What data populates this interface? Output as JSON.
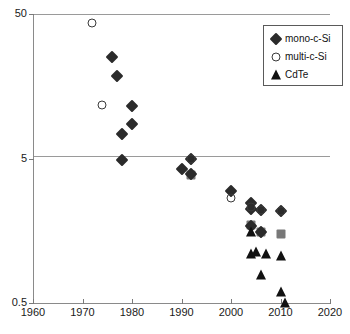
{
  "chart_data": {
    "type": "scatter",
    "title": "",
    "xlabel": "",
    "ylabel": "",
    "xlim": [
      1960,
      2020
    ],
    "ylim": [
      0.5,
      50
    ],
    "yscale": "log",
    "xticks": [
      1960,
      1970,
      1980,
      1990,
      2000,
      2010,
      2020
    ],
    "xtick_labels": [
      "1960",
      "1970",
      "1980",
      "1990",
      "2000",
      "2010",
      "2020"
    ],
    "yticks": [
      0.5,
      5,
      50
    ],
    "ytick_labels": [
      "0.5",
      "5",
      "50"
    ],
    "grid": "horizontal",
    "legend_position": "top-right",
    "series": [
      {
        "name": "mono-c-Si",
        "marker": "filled-diamond",
        "color": "#2b2b2b",
        "points": [
          {
            "x": 1976,
            "y": 25.0
          },
          {
            "x": 1977,
            "y": 18.5
          },
          {
            "x": 1980,
            "y": 11.5
          },
          {
            "x": 1980,
            "y": 8.6
          },
          {
            "x": 1978,
            "y": 7.4
          },
          {
            "x": 1978,
            "y": 4.9
          },
          {
            "x": 1992,
            "y": 5.0
          },
          {
            "x": 1990,
            "y": 4.2
          },
          {
            "x": 1992,
            "y": 3.9
          },
          {
            "x": 2000,
            "y": 3.0
          },
          {
            "x": 2004,
            "y": 2.45
          },
          {
            "x": 2004,
            "y": 2.25
          },
          {
            "x": 2006,
            "y": 2.2
          },
          {
            "x": 2010,
            "y": 2.15
          },
          {
            "x": 2004,
            "y": 1.7
          },
          {
            "x": 2006,
            "y": 1.55
          }
        ]
      },
      {
        "name": "multi-c-Si",
        "marker": "open-circle",
        "color": "#3a3a3a",
        "points": [
          {
            "x": 1972,
            "y": 43.0
          },
          {
            "x": 1974,
            "y": 11.8
          },
          {
            "x": 1992,
            "y": 5.0
          },
          {
            "x": 2000,
            "y": 2.65
          },
          {
            "x": 2004,
            "y": 2.3
          },
          {
            "x": 2006,
            "y": 2.2
          },
          {
            "x": 2010,
            "y": 2.15
          }
        ]
      },
      {
        "name": "CdTe",
        "marker": "filled-triangle",
        "color": "#111111",
        "points": [
          {
            "x": 2004,
            "y": 1.55
          },
          {
            "x": 2004,
            "y": 1.1
          },
          {
            "x": 2005,
            "y": 1.12
          },
          {
            "x": 2007,
            "y": 1.1
          },
          {
            "x": 2010,
            "y": 1.05
          },
          {
            "x": 2006,
            "y": 0.78
          },
          {
            "x": 2010,
            "y": 0.6
          },
          {
            "x": 2011,
            "y": 0.5
          }
        ]
      },
      {
        "name": "gray-overlap",
        "marker": "gray-square",
        "color": "#787878",
        "points": [
          {
            "x": 1992,
            "y": 3.85
          },
          {
            "x": 2004,
            "y": 1.72
          },
          {
            "x": 2006,
            "y": 1.55
          },
          {
            "x": 2010,
            "y": 1.5
          }
        ]
      }
    ]
  },
  "legend": {
    "items": [
      {
        "label": "mono-c-Si",
        "marker": "filled-diamond"
      },
      {
        "label": "multi-c-Si",
        "marker": "open-circle"
      },
      {
        "label": "CdTe",
        "marker": "filled-triangle"
      }
    ]
  }
}
